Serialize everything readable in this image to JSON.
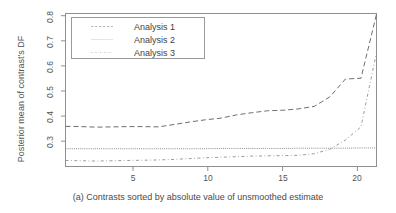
{
  "figure": {
    "caption": "(a) Contrasts sorted by absolute value of unsmoothed estimate",
    "y_axis_title": "Posterior mean of contrast's DF"
  },
  "axes": {
    "y_ticks": [
      "0.3",
      "0.4",
      "0.5",
      "0.6",
      "0.7",
      "0.8"
    ],
    "x_ticks": [
      "5",
      "10",
      "15",
      "20"
    ]
  },
  "legend": {
    "entries": [
      {
        "label": "Analysis 1",
        "style": "dashed"
      },
      {
        "label": "Analysis 2",
        "style": "dotted"
      },
      {
        "label": "Analysis 3",
        "style": "dashdot"
      }
    ]
  },
  "chart_data": {
    "type": "line",
    "title": "",
    "subtitle": "",
    "xlabel": "(a) Contrasts sorted by absolute value of unsmoothed estimate",
    "ylabel": "Posterior mean of contrast's DF",
    "xlim": [
      1,
      21
    ],
    "ylim": [
      0.255,
      0.815
    ],
    "xticks": [
      5,
      10,
      15,
      20
    ],
    "yticks": [
      0.3,
      0.4,
      0.5,
      0.6,
      0.7,
      0.8
    ],
    "grid": false,
    "legend_position": "top-left",
    "x": [
      1,
      2,
      3,
      4,
      5,
      6,
      7,
      8,
      9,
      10,
      11,
      12,
      13,
      14,
      15,
      16,
      17,
      18,
      19,
      20,
      21
    ],
    "series": [
      {
        "name": "Analysis 1",
        "style": "dashed",
        "color": "#6e6e6e",
        "values": [
          0.402,
          0.401,
          0.399,
          0.4,
          0.401,
          0.401,
          0.4,
          0.409,
          0.418,
          0.426,
          0.432,
          0.444,
          0.452,
          0.459,
          0.461,
          0.466,
          0.475,
          0.477,
          0.478,
          0.482,
          0.812
        ],
        "note": "rises gradually then sharply at the right edge; intermediate shape has a plateau near 0.575 between x=19 and x=20"
      },
      {
        "name": "Analysis 2",
        "style": "dotted",
        "color": "#8a8a8a",
        "values": [
          0.32,
          0.32,
          0.32,
          0.32,
          0.32,
          0.32,
          0.32,
          0.32,
          0.32,
          0.32,
          0.321,
          0.321,
          0.321,
          0.321,
          0.321,
          0.322,
          0.322,
          0.322,
          0.322,
          0.323,
          0.323
        ]
      },
      {
        "name": "Analysis 3",
        "style": "dashdot",
        "color": "#9a9a9a",
        "values": [
          0.277,
          0.276,
          0.275,
          0.276,
          0.277,
          0.278,
          0.279,
          0.281,
          0.284,
          0.287,
          0.289,
          0.291,
          0.293,
          0.294,
          0.295,
          0.296,
          0.302,
          0.318,
          0.352,
          0.4,
          0.672
        ]
      }
    ],
    "series_detail": {
      "Analysis 1": {
        "x": [
          1,
          2,
          3,
          4,
          5,
          6,
          7,
          8,
          9,
          10,
          11,
          12,
          13,
          14,
          15,
          16,
          17,
          18,
          19,
          19.6,
          20,
          21
        ],
        "y": [
          0.402,
          0.401,
          0.399,
          0.4,
          0.401,
          0.401,
          0.4,
          0.409,
          0.418,
          0.426,
          0.432,
          0.444,
          0.452,
          0.459,
          0.461,
          0.466,
          0.475,
          0.51,
          0.575,
          0.577,
          0.578,
          0.812
        ]
      },
      "Analysis 3": {
        "x": [
          1,
          2,
          3,
          4,
          5,
          6,
          7,
          8,
          9,
          10,
          11,
          12,
          13,
          14,
          15,
          16,
          17,
          18,
          19,
          20,
          21
        ],
        "y": [
          0.277,
          0.276,
          0.275,
          0.276,
          0.277,
          0.278,
          0.279,
          0.281,
          0.284,
          0.287,
          0.289,
          0.291,
          0.293,
          0.294,
          0.295,
          0.296,
          0.302,
          0.318,
          0.352,
          0.4,
          0.672
        ]
      }
    }
  }
}
